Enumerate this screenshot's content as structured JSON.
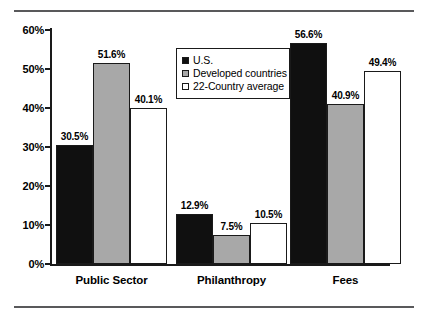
{
  "chart_data": {
    "type": "bar",
    "title": "",
    "subtitle": "",
    "xlabel": "",
    "ylabel": "",
    "categories": [
      "Public Sector",
      "Philanthropy",
      "Fees"
    ],
    "series": [
      {
        "name": "U.S.",
        "key": "us",
        "color": "#101010",
        "values": [
          30.5,
          12.9,
          56.6
        ],
        "labels": [
          "30.5%",
          "12.9%",
          "56.6%"
        ]
      },
      {
        "name": "Developed countries",
        "key": "dev",
        "color": "#a8a8a8",
        "values": [
          51.6,
          7.5,
          40.9
        ],
        "labels": [
          "51.6%",
          "7.5%",
          "40.9%"
        ]
      },
      {
        "name": "22-Country average",
        "key": "avg",
        "color": "#ffffff",
        "values": [
          40.1,
          10.5,
          49.4
        ],
        "labels": [
          "40.1%",
          "10.5%",
          "49.4%"
        ]
      }
    ],
    "ylim": [
      0,
      60
    ],
    "ytick_values": [
      0,
      10,
      20,
      30,
      40,
      50,
      60
    ],
    "ytick_labels": [
      "0%",
      "10%",
      "20%",
      "30%",
      "40%",
      "50%",
      "60%"
    ],
    "grid": false,
    "legend_position": "upper center",
    "value_labels_shown": true,
    "units": "percent"
  },
  "legend": {
    "entries": [
      {
        "label": "U.S.",
        "swatch": "black-square-icon"
      },
      {
        "label": "Developed countries",
        "swatch": "gray-square-icon"
      },
      {
        "label": "22-Country average",
        "swatch": "white-square-icon"
      }
    ]
  },
  "colors": {
    "us": "#101010",
    "developed": "#a8a8a8",
    "average": "#ffffff",
    "axis": "#1a1a1a",
    "rule": "#59595b",
    "background": "#ffffff"
  }
}
